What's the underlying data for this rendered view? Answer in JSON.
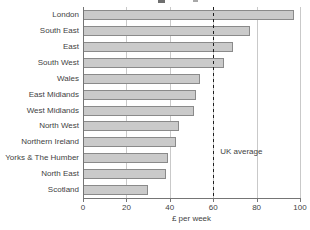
{
  "chart_data": {
    "type": "bar",
    "orientation": "horizontal",
    "title": "",
    "categories": [
      "London",
      "South East",
      "East",
      "South West",
      "Wales",
      "East Midlands",
      "West Midlands",
      "North West",
      "Northern Ireland",
      "Yorks & The Humber",
      "North East",
      "Scotland"
    ],
    "values": [
      97,
      77,
      69,
      65,
      54,
      52,
      51,
      44,
      43,
      39,
      38,
      30
    ],
    "xlabel": "£ per week",
    "xlim": [
      0,
      100
    ],
    "xticks": [
      0,
      20,
      40,
      60,
      80,
      100
    ],
    "grid": true,
    "legend": "none",
    "reference_line": {
      "value": 60,
      "label": "UK average",
      "style": "dashed"
    },
    "colors": {
      "background": "#ffffff",
      "bar_fill": "#cacaca",
      "bar_border": "#8a8a8a",
      "gridline": "#c9c9c9",
      "axis": "#757575",
      "reference_line": "#1f1f1f",
      "text": "#3f3f3f"
    }
  }
}
